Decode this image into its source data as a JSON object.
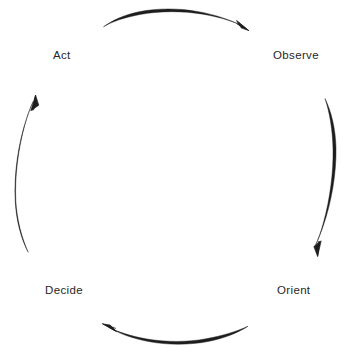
{
  "diagram": {
    "type": "cycle",
    "background_color": "#ffffff",
    "stroke_color": "#1d1d1d",
    "text_color": "#272727",
    "nodes": [
      {
        "id": "act",
        "label": "Act",
        "position": "top-left"
      },
      {
        "id": "observe",
        "label": "Observe",
        "position": "top-right"
      },
      {
        "id": "orient",
        "label": "Orient",
        "position": "bottom-right"
      },
      {
        "id": "decide",
        "label": "Decide",
        "position": "bottom-left"
      }
    ],
    "arrows": [
      {
        "id": "act-to-observe",
        "from": "Act",
        "to": "Observe",
        "direction": "left-to-right",
        "edge": "top"
      },
      {
        "id": "observe-to-orient",
        "from": "Observe",
        "to": "Orient",
        "direction": "top-to-bottom",
        "edge": "right"
      },
      {
        "id": "orient-to-decide",
        "from": "Orient",
        "to": "Decide",
        "direction": "right-to-left",
        "edge": "bottom"
      },
      {
        "id": "decide-to-act",
        "from": "Decide",
        "to": "Act",
        "direction": "bottom-to-top",
        "edge": "left"
      }
    ]
  }
}
